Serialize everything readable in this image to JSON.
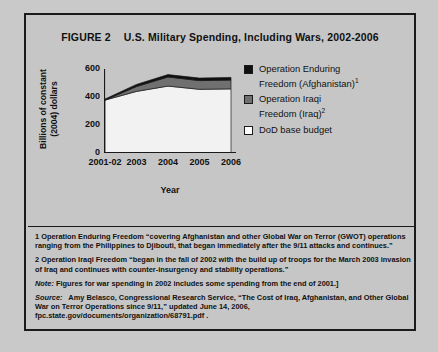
{
  "figure": {
    "number": "FIGURE 2",
    "title": "U.S. Military Spending, Including Wars, 2002-2006"
  },
  "chart_data": {
    "type": "area",
    "stacked": true,
    "title": "U.S. Military Spending, Including Wars, 2002-2006",
    "xlabel": "Year",
    "ylabel": "Billions of constant (2004) dollars",
    "categories": [
      "2001-02",
      "2003",
      "2004",
      "2005",
      "2006"
    ],
    "x_tick_labels": [
      "2001-02",
      "2003",
      "2004",
      "2005",
      "2006"
    ],
    "y_tick_labels": [
      "0",
      "200",
      "400",
      "600"
    ],
    "y_ticks": [
      0,
      200,
      400,
      600
    ],
    "ylim": [
      0,
      600
    ],
    "grid": false,
    "legend_position": "right",
    "series": [
      {
        "name": "DoD base budget",
        "color": "#f2f2f2",
        "values": [
          378,
          440,
          478,
          455,
          458
        ]
      },
      {
        "name": "Operation Iraqi Freedom (Iraq)",
        "color": "#707070",
        "values": [
          0,
          35,
          65,
          62,
          63
        ]
      },
      {
        "name": "Operation Enduring Freedom (Afghanistan)",
        "color": "#101010",
        "values": [
          7,
          15,
          17,
          18,
          19
        ]
      }
    ],
    "totals": [
      385,
      490,
      560,
      535,
      540
    ]
  },
  "legend": {
    "items": [
      {
        "swatch": "#101010",
        "line1": "Operation Enduring",
        "line2": "Freedom (Afghanistan)",
        "superscript": "1"
      },
      {
        "swatch": "#707070",
        "line1": "Operation Iraqi",
        "line2": "Freedom (Iraq)",
        "superscript": "2"
      },
      {
        "swatch": "#ffffff",
        "line1": "DoD base budget",
        "line2": "",
        "superscript": ""
      }
    ]
  },
  "notes": {
    "footnote_1": "1 Operation Enduring Freedom “covering Afghanistan and other Global War on Terror (GWOT) operations ranging from the Philippines to Djibouti, that began immediately after the 9/11 attacks and continues.”",
    "footnote_2": "2 Operation Iraqi Freedom “began in the fall of 2002 with the build up of troops for the March 2003 invasion of Iraq and continues with counter-insurgency and stability operations.”",
    "note_label": "Note:",
    "note_text": "Figures for war spending in 2002 includes some spending from the end of 2001.]",
    "source_label": "Source:",
    "source_text": "Amy Belasco, Congressional Research Service, “The Cost of Iraq, Afghanistan, and Other Global War on Terror Operations since 9/11,” updated June 14, 2006, fpc.state.gov/documents/organization/68791.pdf ."
  }
}
